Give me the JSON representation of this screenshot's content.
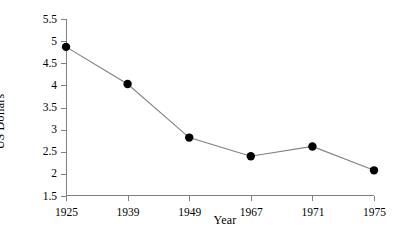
{
  "chart_data": {
    "type": "line",
    "title": "",
    "xlabel": "Year",
    "ylabel": "US Dollars",
    "categories": [
      "1925",
      "1939",
      "1949",
      "1967",
      "1971",
      "1975"
    ],
    "values": [
      4.87,
      4.03,
      2.82,
      2.4,
      2.62,
      2.08
    ],
    "series": [
      {
        "name": "US Dollars",
        "values": [
          4.87,
          4.03,
          2.82,
          2.4,
          2.62,
          2.08
        ]
      }
    ],
    "ylim": [
      1.5,
      5.5
    ],
    "ytick_labels": [
      "1.5",
      "2",
      "2.5",
      "3",
      "3.5",
      "4",
      "4.5",
      "5",
      "5.5"
    ],
    "ytick_values": [
      1.5,
      2,
      2.5,
      3,
      3.5,
      4,
      4.5,
      5,
      5.5
    ],
    "grid": false,
    "legend": "none",
    "marker": "filled-circle",
    "marker_color": "#000000",
    "line_color": "#808080",
    "axis_color": "#808080",
    "background": "#ffffff"
  }
}
